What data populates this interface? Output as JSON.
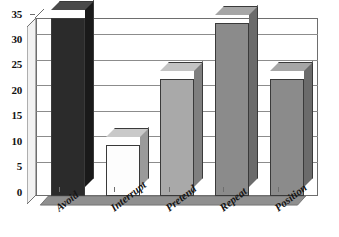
{
  "chart_data": {
    "type": "bar",
    "title": "",
    "subtitle": "",
    "xlabel": "",
    "ylabel": "",
    "categories": [
      "Avoid",
      "Interrupt",
      "Pretend",
      "Repeat",
      "Position"
    ],
    "values": [
      35,
      10,
      23,
      34,
      23
    ],
    "series": [
      {
        "name": "",
        "values": [
          35,
          10,
          23,
          34,
          23
        ]
      }
    ],
    "ylim": [
      0,
      35
    ],
    "ytick_labels": [
      "0",
      "5",
      "10",
      "15",
      "20",
      "25",
      "30",
      "35"
    ],
    "ytick_values": [
      0,
      5,
      10,
      15,
      20,
      25,
      30,
      35
    ],
    "grid": true,
    "legend": false,
    "legend_position": "none",
    "style": "3d-column",
    "bar_colors": [
      "#2b2b2b",
      "#fdfdfd",
      "#a9a9a9",
      "#8b8b8b",
      "#8b8b8b"
    ],
    "bar_top_colors": [
      "#4a4a4a",
      "#c9c9c9",
      "#c3c3c3",
      "#a6a6a6",
      "#a6a6a6"
    ],
    "bar_side_colors": [
      "#1a1a1a",
      "#9a9a9a",
      "#7f7f7f",
      "#6b6b6b",
      "#6b6b6b"
    ],
    "axis_color": "#6e6e6e",
    "gridline_color": "#8c8c8c",
    "background_color": "#ffffff",
    "annotations": []
  }
}
